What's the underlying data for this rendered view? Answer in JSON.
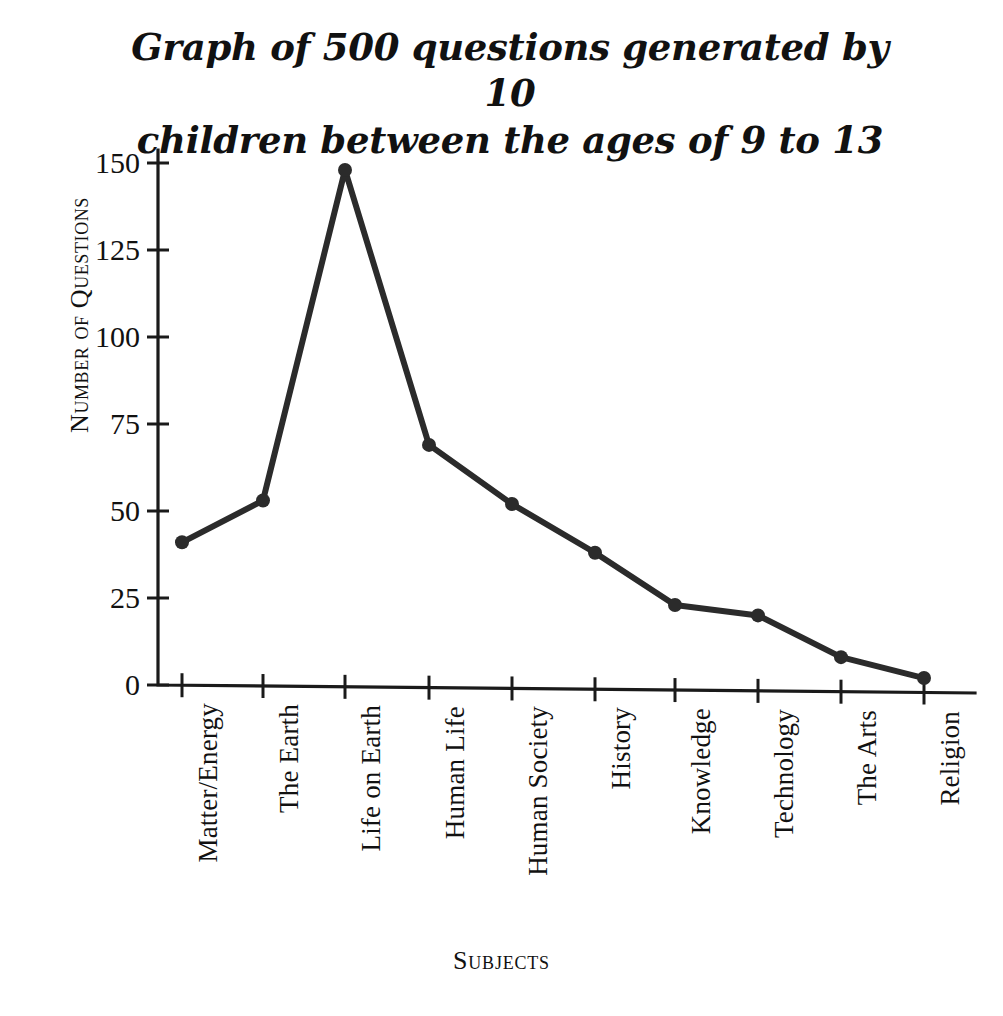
{
  "chart_data": {
    "type": "line",
    "title": "Graph of 500 questions generated by 10 children between the ages of 9 to 13",
    "title_lines": [
      "Graph of 500 questions generated by 10",
      "children between the ages of 9 to 13"
    ],
    "xlabel": "Subjects",
    "ylabel": "Number of Questions",
    "categories": [
      "Matter/Energy",
      "The Earth",
      "Life on Earth",
      "Human Life",
      "Human Society",
      "History",
      "Knowledge",
      "Technology",
      "The Arts",
      "Religion"
    ],
    "values": [
      41,
      53,
      148,
      69,
      52,
      38,
      23,
      20,
      8,
      2
    ],
    "ylim": [
      0,
      155
    ],
    "yticks": [
      0,
      25,
      50,
      75,
      100,
      125,
      150
    ],
    "ytick_labels": [
      "0",
      "25",
      "50",
      "75",
      "100",
      "125",
      "150"
    ],
    "grid": false,
    "legend": false,
    "series_color": "#2b2b2b",
    "marker": "circle",
    "marker_size": 9,
    "line_width": 6,
    "axis_color": "#1a1a1a",
    "background": "#ffffff"
  }
}
